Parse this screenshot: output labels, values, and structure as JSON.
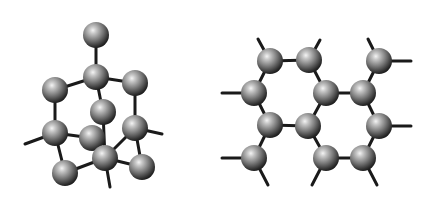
{
  "figure": {
    "background": "#ffffff",
    "bond_color": "#1a1a1a",
    "atom_style": {
      "radius": 13,
      "highlight": "#f2f2f2",
      "mid": "#8a8a8a",
      "shadow": "#2a2a2a"
    }
  },
  "molecules": [
    {
      "name": "cage-molecule-left",
      "atoms": [
        [
          96,
          35
        ],
        [
          96,
          77
        ],
        [
          55,
          90
        ],
        [
          135,
          83
        ],
        [
          103,
          112
        ],
        [
          55,
          133
        ],
        [
          135,
          128
        ],
        [
          92,
          138
        ],
        [
          105,
          158
        ],
        [
          65,
          173
        ],
        [
          142,
          167
        ]
      ],
      "bonds": [
        [
          0,
          1
        ],
        [
          1,
          2
        ],
        [
          1,
          3
        ],
        [
          1,
          4
        ],
        [
          2,
          5
        ],
        [
          3,
          6
        ],
        [
          5,
          7
        ],
        [
          5,
          9
        ],
        [
          6,
          10
        ],
        [
          6,
          8
        ],
        [
          7,
          8
        ],
        [
          8,
          9
        ],
        [
          8,
          10
        ],
        [
          4,
          8
        ]
      ],
      "stubs": [
        [
          [
            55,
            133
          ],
          [
            25,
            144
          ]
        ],
        [
          [
            135,
            128
          ],
          [
            162,
            134
          ]
        ],
        [
          [
            105,
            158
          ],
          [
            110,
            187
          ]
        ]
      ]
    },
    {
      "name": "fused-ring-molecule-right",
      "atoms": [
        [
          270,
          61
        ],
        [
          309,
          60
        ],
        [
          379,
          61
        ],
        [
          254,
          93
        ],
        [
          326,
          93
        ],
        [
          363,
          93
        ],
        [
          270,
          125
        ],
        [
          308,
          126
        ],
        [
          379,
          126
        ],
        [
          254,
          158
        ],
        [
          326,
          158
        ],
        [
          363,
          158
        ]
      ],
      "bonds": [
        [
          0,
          1
        ],
        [
          0,
          3
        ],
        [
          1,
          4
        ],
        [
          3,
          6
        ],
        [
          4,
          7
        ],
        [
          6,
          7
        ],
        [
          4,
          5
        ],
        [
          5,
          2
        ],
        [
          5,
          8
        ],
        [
          8,
          11
        ],
        [
          11,
          10
        ],
        [
          10,
          7
        ],
        [
          6,
          9
        ]
      ],
      "stubs": [
        [
          [
            270,
            61
          ],
          [
            258,
            39
          ]
        ],
        [
          [
            309,
            60
          ],
          [
            320,
            40
          ]
        ],
        [
          [
            379,
            61
          ],
          [
            368,
            39
          ]
        ],
        [
          [
            379,
            61
          ],
          [
            411,
            61
          ]
        ],
        [
          [
            254,
            93
          ],
          [
            222,
            93
          ]
        ],
        [
          [
            379,
            126
          ],
          [
            411,
            126
          ]
        ],
        [
          [
            254,
            158
          ],
          [
            222,
            158
          ]
        ],
        [
          [
            254,
            158
          ],
          [
            268,
            185
          ]
        ],
        [
          [
            326,
            158
          ],
          [
            312,
            185
          ]
        ],
        [
          [
            363,
            158
          ],
          [
            377,
            185
          ]
        ]
      ]
    }
  ]
}
